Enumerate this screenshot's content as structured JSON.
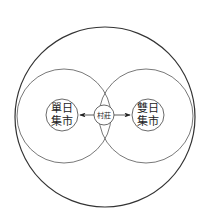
{
  "diagram": {
    "outer_circle": {
      "cx": 105,
      "cy": 117,
      "r": 90
    },
    "left_region": {
      "cx": 64,
      "cy": 116,
      "r": 47
    },
    "right_region": {
      "cx": 146,
      "cy": 116,
      "r": 47
    },
    "nodes": [
      {
        "id": "single-day-market",
        "line1": "單日",
        "line2": "集市",
        "cx": 62,
        "cy": 115,
        "r": 16
      },
      {
        "id": "village",
        "label": "村莊",
        "cx": 104,
        "cy": 115,
        "r": 10
      },
      {
        "id": "double-day-market",
        "line1": "雙日",
        "line2": "集市",
        "cx": 148,
        "cy": 115,
        "r": 16
      }
    ],
    "arrows": [
      {
        "from": "village",
        "to": "single-day-market"
      },
      {
        "from": "village",
        "to": "double-day-market"
      }
    ],
    "colors": {
      "stroke": "#333333",
      "background": "#ffffff"
    }
  }
}
